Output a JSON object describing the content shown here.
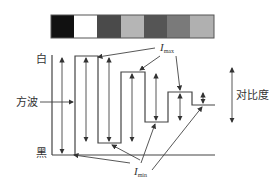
{
  "gray_bar": {
    "swatches": [
      "#111111",
      "#ffffff",
      "#4a4a4a",
      "#b5b5b5",
      "#555555",
      "#7a7a7a",
      "#b0b0b0"
    ],
    "border": "#555555"
  },
  "labels": {
    "white": "白",
    "black": "黑",
    "square_wave": "方波",
    "contrast": "对比度",
    "imax_base": "I",
    "imax_sub": "max",
    "imin_base": "I",
    "imin_sub": "min"
  },
  "colors": {
    "line": "#444444"
  }
}
